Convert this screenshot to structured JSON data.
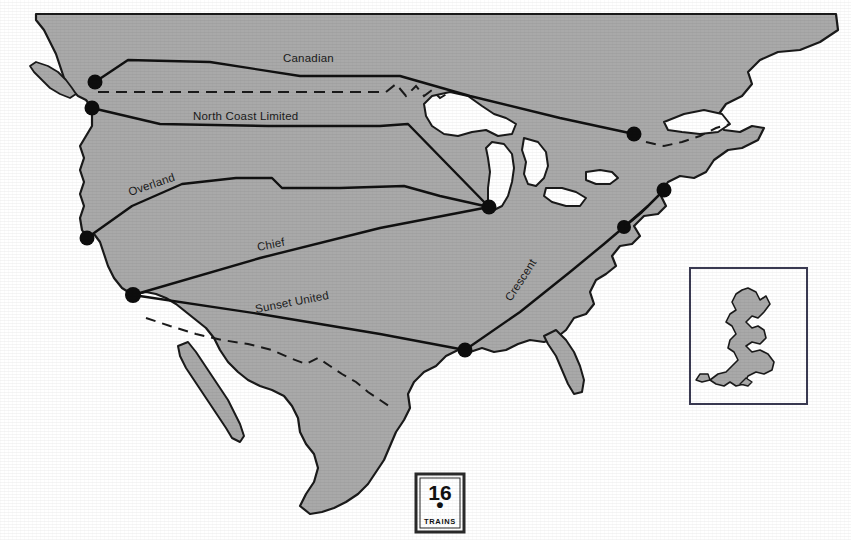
{
  "figure": {
    "number": "16",
    "caption": "TRAINS",
    "separator_dot": "•"
  },
  "map": {
    "title": "North American named passenger train routes",
    "colors": {
      "land_fill": "#a9a9a9",
      "water_fill": "#ffffff",
      "coastline": "#1a1a1a",
      "route_line": "#111111",
      "border_dashed": "#1a1a1a",
      "city_dot": "#0d0d0d",
      "page_background": "#ffffff",
      "box_border": "#3a3a52"
    },
    "routes": [
      {
        "name": "Canadian",
        "label": "Canadian",
        "label_x": 283,
        "label_y": 62,
        "rotation": 0,
        "style": "solid"
      },
      {
        "name": "North Coast Limited",
        "label": "North Coast Limited",
        "label_x": 193,
        "label_y": 120,
        "rotation": 0,
        "style": "solid"
      },
      {
        "name": "Overland",
        "label": "Overland",
        "label_x": 130,
        "label_y": 196,
        "rotation": -19,
        "style": "solid"
      },
      {
        "name": "Chief",
        "label": "Chief",
        "label_x": 258,
        "label_y": 251,
        "rotation": -11,
        "style": "solid"
      },
      {
        "name": "Sunset United",
        "label": "Sunset United",
        "label_x": 256,
        "label_y": 313,
        "rotation": -11,
        "style": "solid"
      },
      {
        "name": "Crescent",
        "label": "Crescent",
        "label_x": 511,
        "label_y": 302,
        "rotation": -57,
        "style": "solid"
      }
    ],
    "cities": [
      {
        "name": "vancouver",
        "x": 95,
        "y": 82,
        "r": 7.5
      },
      {
        "name": "seattle",
        "x": 92,
        "y": 108,
        "r": 7.5
      },
      {
        "name": "san-francisco",
        "x": 87,
        "y": 238,
        "r": 7.5
      },
      {
        "name": "los-angeles",
        "x": 133,
        "y": 295,
        "r": 8.0
      },
      {
        "name": "chicago",
        "x": 489,
        "y": 207,
        "r": 7.5
      },
      {
        "name": "montreal",
        "x": 634,
        "y": 134,
        "r": 7.5
      },
      {
        "name": "new-york",
        "x": 664,
        "y": 190,
        "r": 7.5
      },
      {
        "name": "washington",
        "x": 624,
        "y": 227,
        "r": 7.0
      },
      {
        "name": "new-orleans",
        "x": 465,
        "y": 350,
        "r": 7.5
      }
    ],
    "inset": {
      "name": "great-britain-scale-inset",
      "box": {
        "x": 690,
        "y": 268,
        "width": 117,
        "height": 136
      },
      "shape_label": "Great Britain"
    }
  }
}
